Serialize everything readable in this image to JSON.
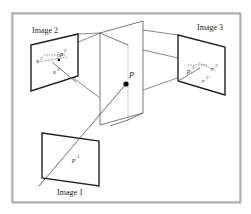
{
  "diagram": {
    "type": "multi-view-geometry",
    "colors": {
      "frame": "#8a8a8a",
      "image_border": "#222222",
      "line": "#444444",
      "point": "#000000",
      "background": "#ffffff"
    },
    "labels": {
      "image1": "Image 1",
      "image2": "Image 2",
      "image3": "Image 3",
      "point": "P",
      "p1": "p",
      "p1_sup": "1",
      "p2": "p",
      "p2_sup": "2",
      "s1": "s",
      "s1_sub": "1",
      "s1_sup": "2",
      "s2": "s",
      "s2_sub": "2",
      "s2_sup": "2",
      "p3": "p",
      "p3_sup": "3",
      "r1": "r",
      "r1_sub": "1",
      "r1_sup": "3",
      "r2": "r",
      "r2_sub": "2",
      "r2_sup": "3"
    }
  }
}
